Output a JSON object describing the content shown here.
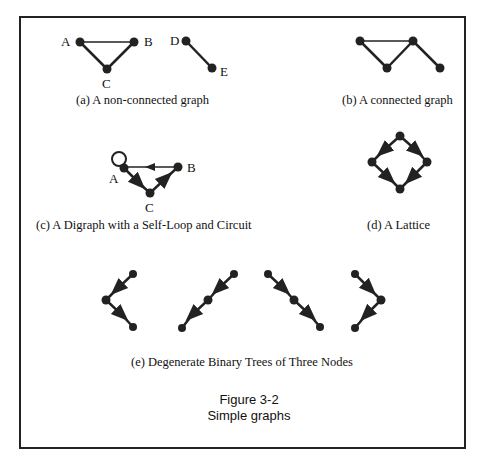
{
  "graphs": {
    "a": {
      "caption": "(a) A non-connected graph",
      "labels": {
        "A": "A",
        "B": "B",
        "C": "C",
        "D": "D",
        "E": "E"
      }
    },
    "b": {
      "caption": "(b) A connected graph"
    },
    "c": {
      "caption": "(c) A Digraph with a Self-Loop and Circuit",
      "labels": {
        "A": "A",
        "B": "B",
        "C": "C"
      }
    },
    "d": {
      "caption": "(d) A Lattice"
    },
    "e": {
      "caption": "(e) Degenerate Binary Trees of Three Nodes"
    }
  },
  "figure": {
    "number": "Figure 3-2",
    "title": "Simple graphs"
  }
}
